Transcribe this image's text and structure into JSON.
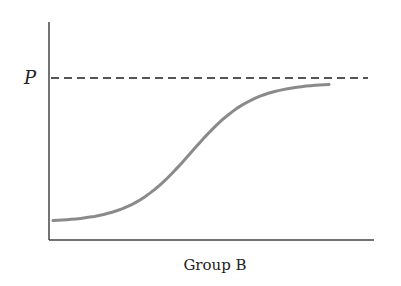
{
  "chart_data": {
    "type": "line",
    "title": "",
    "xlabel": "Group B",
    "ylabel": "",
    "grid": false,
    "legend": null,
    "reference_line": {
      "label": "P",
      "style": "dashed",
      "y": 1.0
    },
    "series": [
      {
        "name": "sigmoid curve",
        "shape": "logistic (S-curve) approaching P",
        "x": [
          0.0,
          0.1,
          0.2,
          0.3,
          0.4,
          0.5,
          0.6,
          0.7,
          0.8,
          0.9,
          1.0
        ],
        "values": [
          0.12,
          0.14,
          0.19,
          0.27,
          0.42,
          0.6,
          0.76,
          0.87,
          0.93,
          0.95,
          0.96
        ]
      }
    ],
    "xlim": [
      0,
      1.15
    ],
    "ylim": [
      0,
      1.15
    ],
    "colors": {
      "axis": "#444444",
      "dashed_line": "#555555",
      "curve": "#8a8a8a"
    }
  },
  "labels": {
    "p_label": "P",
    "x_axis_label": "Group B"
  }
}
